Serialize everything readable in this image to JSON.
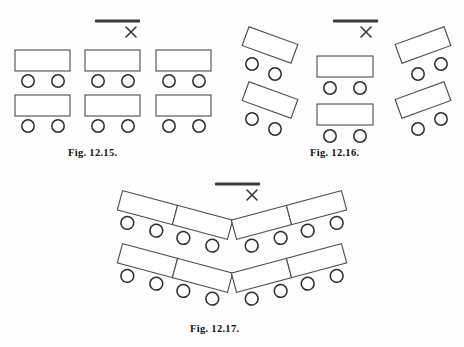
{
  "page": {
    "background_color": "#fefefe",
    "ink_color": "#2b2b2b",
    "table_fill": "#ffffff",
    "table_stroke": "#4a4a4a",
    "chair_stroke": "#2b2b2b",
    "screen_color": "#3a3a3a"
  },
  "figures": [
    {
      "id": "fig-12-15",
      "caption": "Fig. 12.15.",
      "layout_name": "classroom-rows",
      "screen": {
        "bar_label": "whiteboard-bar",
        "x_label": "×"
      },
      "table_count": 6,
      "chair_count": 12,
      "tables": [
        {
          "x": 15,
          "y": 50,
          "w": 55,
          "h": 21,
          "rotate": 0
        },
        {
          "x": 85,
          "y": 50,
          "w": 55,
          "h": 21,
          "rotate": 0
        },
        {
          "x": 156,
          "y": 50,
          "w": 55,
          "h": 21,
          "rotate": 0
        },
        {
          "x": 15,
          "y": 95,
          "w": 55,
          "h": 21,
          "rotate": 0
        },
        {
          "x": 85,
          "y": 95,
          "w": 55,
          "h": 21,
          "rotate": 0
        },
        {
          "x": 156,
          "y": 95,
          "w": 55,
          "h": 21,
          "rotate": 0
        }
      ],
      "chairs": [
        {
          "cx": 28,
          "cy": 81,
          "r": 6.2
        },
        {
          "cx": 58,
          "cy": 81,
          "r": 6.2
        },
        {
          "cx": 98,
          "cy": 81,
          "r": 6.2
        },
        {
          "cx": 128,
          "cy": 81,
          "r": 6.2
        },
        {
          "cx": 169,
          "cy": 81,
          "r": 6.2
        },
        {
          "cx": 199,
          "cy": 81,
          "r": 6.2
        },
        {
          "cx": 28,
          "cy": 126,
          "r": 6.2
        },
        {
          "cx": 58,
          "cy": 126,
          "r": 6.2
        },
        {
          "cx": 98,
          "cy": 126,
          "r": 6.2
        },
        {
          "cx": 128,
          "cy": 126,
          "r": 6.2
        },
        {
          "cx": 169,
          "cy": 126,
          "r": 6.2
        },
        {
          "cx": 199,
          "cy": 126,
          "r": 6.2
        }
      ],
      "screen_bar": {
        "x1": 95,
        "y1": 21,
        "x2": 140,
        "y2": 21,
        "thickness": 3
      },
      "x_mark": {
        "cx": 131,
        "cy": 32,
        "size": 5.5
      }
    },
    {
      "id": "fig-12-16",
      "caption": "Fig. 12.16.",
      "layout_name": "horseshoe-angled-clusters",
      "screen": {
        "bar_label": "whiteboard-bar",
        "x_label": "×"
      },
      "table_count": 6,
      "chair_count": 12,
      "tables": [
        {
          "x": 244,
          "y": 35,
          "w": 52,
          "h": 20,
          "rotate": 20
        },
        {
          "x": 244,
          "y": 90,
          "w": 52,
          "h": 20,
          "rotate": 20
        },
        {
          "x": 317,
          "y": 56,
          "w": 56,
          "h": 21,
          "rotate": 0
        },
        {
          "x": 317,
          "y": 104,
          "w": 56,
          "h": 21,
          "rotate": 0
        },
        {
          "x": 399,
          "y": 35,
          "w": 52,
          "h": 20,
          "rotate": -20
        },
        {
          "x": 399,
          "y": 90,
          "w": 52,
          "h": 20,
          "rotate": -20
        }
      ],
      "chairs": [
        {
          "cx": 252,
          "cy": 64,
          "r": 6.2
        },
        {
          "cx": 275,
          "cy": 74,
          "r": 6.2
        },
        {
          "cx": 252,
          "cy": 119,
          "r": 6.2
        },
        {
          "cx": 275,
          "cy": 129,
          "r": 6.2
        },
        {
          "cx": 330,
          "cy": 88,
          "r": 6.2
        },
        {
          "cx": 360,
          "cy": 88,
          "r": 6.2
        },
        {
          "cx": 330,
          "cy": 136,
          "r": 6.2
        },
        {
          "cx": 360,
          "cy": 136,
          "r": 6.2
        },
        {
          "cx": 418,
          "cy": 74,
          "r": 6.2
        },
        {
          "cx": 441,
          "cy": 64,
          "r": 6.2
        },
        {
          "cx": 418,
          "cy": 129,
          "r": 6.2
        },
        {
          "cx": 441,
          "cy": 119,
          "r": 6.2
        }
      ],
      "screen_bar": {
        "x1": 333,
        "y1": 21,
        "x2": 378,
        "y2": 21,
        "thickness": 3
      },
      "x_mark": {
        "cx": 366,
        "cy": 32,
        "size": 5.5
      }
    },
    {
      "id": "fig-12-17",
      "caption": "Fig. 12.17.",
      "layout_name": "chevron-v-rows",
      "screen": {
        "bar_label": "whiteboard-bar",
        "x_label": "×"
      },
      "table_count": 8,
      "chair_count": 16,
      "arms": [
        {
          "side": "left",
          "row": "front",
          "rotate": 15,
          "tables": 2,
          "chairs": 4
        },
        {
          "side": "right",
          "row": "front",
          "rotate": -15,
          "tables": 2,
          "chairs": 4
        },
        {
          "side": "left",
          "row": "back",
          "rotate": 15,
          "tables": 2,
          "chairs": 4
        },
        {
          "side": "right",
          "row": "back",
          "rotate": -15,
          "tables": 2,
          "chairs": 4
        }
      ],
      "screen_bar": {
        "x1": 215,
        "y1": 184,
        "x2": 260,
        "y2": 184,
        "thickness": 3
      },
      "x_mark": {
        "cx": 252,
        "cy": 195,
        "size": 5.5
      }
    }
  ]
}
